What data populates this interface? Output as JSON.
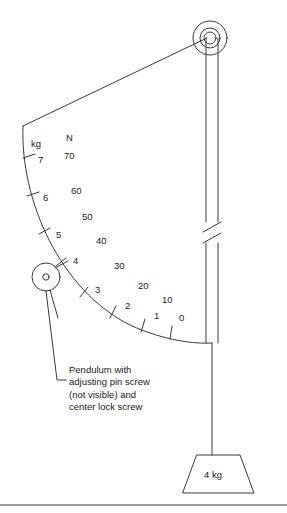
{
  "figure": {
    "background_color": "#ffffff",
    "line_color": "#3a3a3a"
  },
  "scale": {
    "unit_headers": {
      "kg": "kg",
      "newton": "N"
    },
    "kg_ticks": [
      {
        "label": "7",
        "x": 38,
        "y": 155
      },
      {
        "label": "6",
        "x": 43,
        "y": 193
      },
      {
        "label": "5",
        "x": 56,
        "y": 230
      },
      {
        "label": "4",
        "x": 73,
        "y": 260
      },
      {
        "label": "3",
        "x": 95,
        "y": 288
      },
      {
        "label": "2",
        "x": 125,
        "y": 305
      },
      {
        "label": "1",
        "x": 154,
        "y": 316
      },
      {
        "label": "0",
        "x": 179,
        "y": 318
      }
    ],
    "newton_ticks": [
      {
        "label": "70",
        "x": 66,
        "y": 150
      },
      {
        "label": "60",
        "x": 72,
        "y": 187
      },
      {
        "label": "50",
        "x": 83,
        "y": 214
      },
      {
        "label": "40",
        "x": 96,
        "y": 238
      },
      {
        "label": "30",
        "x": 115,
        "y": 263
      },
      {
        "label": "20",
        "x": 139,
        "y": 283
      },
      {
        "label": "10",
        "x": 163,
        "y": 298
      }
    ]
  },
  "annotations": {
    "pendulum_caption": "Pendulum with adjusting pin screw (not visible) and center lock screw"
  },
  "weight": {
    "label": "4 kg"
  },
  "parts": {
    "pulley": "pulley-wheel",
    "pivot": "pendulum-pivot",
    "rod": "vertical-rod",
    "break_mark": "rod-break-mark",
    "arc": "measurement-arc",
    "string": "pendulum-string",
    "leader": "caption-leader-line",
    "rule": "bottom-divider"
  }
}
